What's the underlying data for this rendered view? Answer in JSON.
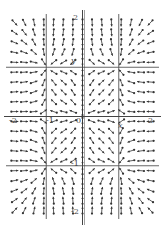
{
  "chart_data": {
    "type": "vector_field",
    "title": "",
    "xlabel": "x",
    "ylabel": "y",
    "xlim": [
      -2,
      2
    ],
    "ylim": [
      -2,
      2
    ],
    "system": {
      "dx": "x*(1-x^2)",
      "dy": "y*(1-y^2)"
    },
    "grid_lines": {
      "x": [
        -1,
        1
      ],
      "y": [
        -1,
        1
      ]
    },
    "grid": {
      "cols": 15,
      "rows": 20
    },
    "equilibria": {
      "sinks": [
        [
          1,
          1
        ],
        [
          -1,
          1
        ],
        [
          1,
          -1
        ],
        [
          -1,
          -1
        ]
      ],
      "source": [
        0,
        0
      ],
      "saddles": [
        [
          0,
          1
        ],
        [
          0,
          -1
        ],
        [
          1,
          0
        ],
        [
          -1,
          0
        ]
      ]
    },
    "tick_labels": {
      "x": [
        {
          "value": -2,
          "label": "-2"
        },
        {
          "value": -1,
          "label": "-1"
        },
        {
          "value": 0,
          "label": "0"
        },
        {
          "value": 2,
          "label": "2"
        }
      ],
      "y": [
        {
          "value": 2,
          "label": "2"
        },
        {
          "value": -1,
          "label": "-1"
        },
        {
          "value": -2,
          "label": "-2"
        }
      ]
    }
  },
  "labels": {
    "y_top": "2",
    "y_axis": "y",
    "x_left": "-2",
    "x_neg1": "-1",
    "origin": "0",
    "x_axis": "x",
    "x_right": "2",
    "y_neg1": "-1",
    "y_bottom": "-2"
  },
  "colors": {
    "arrow": "#333333",
    "axis": "#444444",
    "grid": "#555555",
    "background": "#ffffff"
  }
}
